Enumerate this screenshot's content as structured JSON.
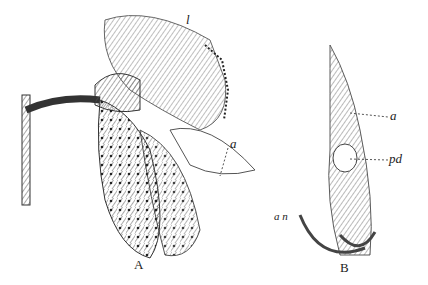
{
  "figure": {
    "panels": [
      {
        "id": "A",
        "caption": "A",
        "labels": [
          "l",
          "a"
        ]
      },
      {
        "id": "B",
        "caption": "B",
        "labels": [
          "a",
          "pd",
          "a n"
        ]
      }
    ]
  },
  "labels": {
    "A_l": "l",
    "A_a": "a",
    "B_a": "a",
    "B_pd": "pd",
    "B_an": "a n"
  },
  "captions": {
    "A": "A",
    "B": "B"
  },
  "colors": {
    "ink": "#222222",
    "shade": "#777777",
    "paper": "#ffffff"
  }
}
